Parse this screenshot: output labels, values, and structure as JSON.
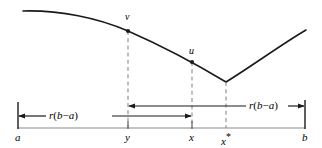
{
  "figure": {
    "type": "line-diagram",
    "background_color": "#ffffff",
    "stroke_color": "#1a1a1a",
    "dashed_color": "#8a8a8a",
    "axis_labels": [
      {
        "id": "a",
        "text": "a",
        "x": 18,
        "y": 136
      },
      {
        "id": "y",
        "text": "y",
        "x": 128,
        "y": 136
      },
      {
        "id": "x",
        "text": "x",
        "x": 192,
        "y": 136
      },
      {
        "id": "xstar",
        "text": "x",
        "superscript": "*",
        "x": 226,
        "y": 136
      },
      {
        "id": "b",
        "text": "b",
        "x": 305,
        "y": 136
      }
    ],
    "point_labels": [
      {
        "id": "v",
        "text": "v",
        "x": 128,
        "y": 18
      },
      {
        "id": "u",
        "text": "u",
        "x": 192,
        "y": 52
      }
    ],
    "measures": [
      {
        "id": "measure-left",
        "text": "r(b − a)",
        "label_x": 78,
        "label_y": 119,
        "from_x": 18,
        "to_x": 192,
        "row_y": 116
      },
      {
        "id": "measure-right",
        "text": "r(b − a)",
        "label_x": 262,
        "label_y": 109,
        "from_x": 128,
        "to_x": 305,
        "row_y": 106
      }
    ],
    "measure_text_parts": {
      "r": "r",
      "open_paren": "(",
      "b": "b",
      "minus": "−",
      "a": "a",
      "close_paren": ")"
    },
    "curve": {
      "left_branch_path": "M 23,11 C 60,10 98,18 128,31 C 160,45 196,64 226,82",
      "right_branch_path": "M 226,82 C 252,66 282,44 306,30",
      "vertex_x": 226,
      "vertex_y": 82
    },
    "marked_points": [
      {
        "id": "point-v",
        "x": 128,
        "y": 31
      },
      {
        "id": "point-u",
        "x": 192,
        "y": 62
      }
    ],
    "dashed_verticals": [
      {
        "id": "dash-v",
        "x": 128,
        "y_top": 31,
        "y_bottom": 128
      },
      {
        "id": "dash-u",
        "x": 192,
        "y_top": 62,
        "y_bottom": 128
      },
      {
        "id": "dash-xstar",
        "x": 226,
        "y_top": 82,
        "y_bottom": 128
      }
    ],
    "baseline": {
      "x1": 18,
      "x2": 305,
      "y": 128
    },
    "end_ticks": [
      {
        "id": "tick-a",
        "x": 18,
        "y_top": 102,
        "y_bottom": 128
      },
      {
        "id": "tick-b",
        "x": 305,
        "y_top": 100,
        "y_bottom": 128
      }
    ],
    "baseline_ticks": [
      {
        "id": "tick-y",
        "x": 128,
        "y_top": 122,
        "y_bottom": 128
      },
      {
        "id": "tick-x",
        "x": 192,
        "y_top": 122,
        "y_bottom": 128
      }
    ]
  }
}
